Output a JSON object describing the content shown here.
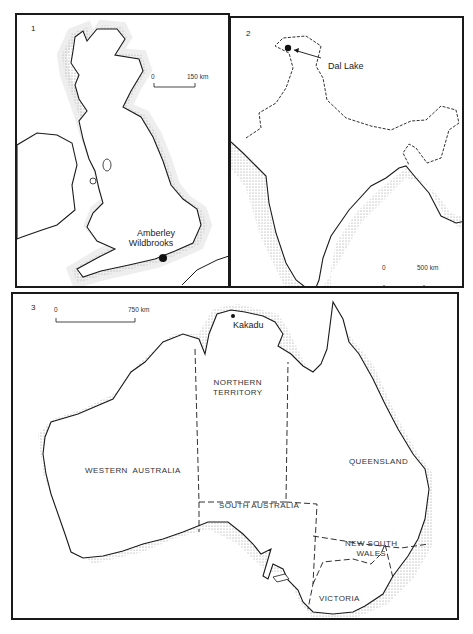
{
  "figure": {
    "panels": [
      {
        "number": "1",
        "region": "British Isles",
        "scale": {
          "zero": "0",
          "end": "150 km"
        },
        "sites": [
          {
            "label_line1": "Amberley",
            "label_line2": "Wildbrooks"
          }
        ]
      },
      {
        "number": "2",
        "region": "India",
        "scale": {
          "zero": "0",
          "end": "500 km"
        },
        "sites": [
          {
            "label": "Dal Lake"
          }
        ]
      },
      {
        "number": "3",
        "region": "Australia",
        "scale": {
          "zero": "0",
          "end": "750 km"
        },
        "sites": [
          {
            "label": "Kakadu"
          }
        ],
        "states": [
          {
            "line1": "NORTHERN",
            "line2": "TERRITORY"
          },
          {
            "line1": "WESTERN  AUSTRALIA"
          },
          {
            "line1": "QUEENSLAND"
          },
          {
            "line1": "SOUTH AUSTRALIA"
          },
          {
            "line1": "NEW SOUTH",
            "line2": "WALES"
          },
          {
            "line1": "VICTORIA"
          }
        ]
      }
    ],
    "colors": {
      "ink": "#1a1a1a",
      "stipple": "#9a9a9a",
      "paper": "#ffffff"
    }
  }
}
